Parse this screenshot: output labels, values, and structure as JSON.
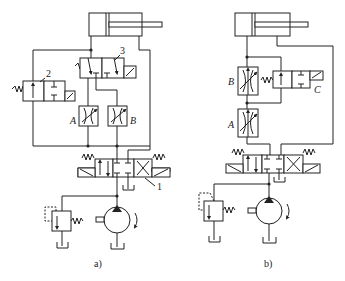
{
  "diagram": {
    "type": "hydraulic-circuit",
    "panels": [
      {
        "id": "a",
        "caption": "a)",
        "labels": {
          "valve_2": "2",
          "valve_3": "3",
          "valve_1": "1",
          "throttle_A": "A",
          "throttle_B": "B"
        },
        "components": [
          "hydraulic-cylinder",
          "2-position-3-way-solenoid-valve-3",
          "2-position-2-way-solenoid-valve-2",
          "throttle-valve-A",
          "throttle-valve-B",
          "3-position-4-way-solenoid-directional-valve-1",
          "relief-valve",
          "hydraulic-pump",
          "tank"
        ]
      },
      {
        "id": "b",
        "caption": "b)",
        "labels": {
          "throttle_A": "A",
          "throttle_B": "B",
          "valve_C": "C"
        },
        "components": [
          "hydraulic-cylinder",
          "throttle-valve-B",
          "throttle-valve-A",
          "2-position-2-way-solenoid-valve-C",
          "3-position-4-way-solenoid-directional-valve",
          "relief-valve",
          "hydraulic-pump",
          "tank"
        ]
      }
    ]
  }
}
